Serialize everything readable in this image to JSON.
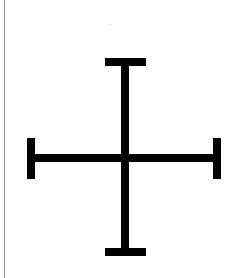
{
  "figure": {
    "symbol": "cross-with-terminal-bars",
    "stroke_color": "#000000",
    "background_color": "#ffffff",
    "border_color": "#9a9a9a",
    "canvas": {
      "width": 230,
      "height": 278
    },
    "elements": {
      "vertical_stem": {
        "x": 121,
        "y": 62,
        "width": 8,
        "height": 190
      },
      "horizontal_stem": {
        "x": 31,
        "y": 154,
        "width": 186,
        "height": 8
      },
      "top_cap": {
        "x": 105,
        "y": 58,
        "width": 41,
        "height": 8
      },
      "bottom_cap": {
        "x": 105,
        "y": 248,
        "width": 41,
        "height": 8
      },
      "left_cap": {
        "x": 27,
        "y": 138,
        "width": 8,
        "height": 41
      },
      "right_cap": {
        "x": 213,
        "y": 138,
        "width": 8,
        "height": 41
      }
    }
  }
}
